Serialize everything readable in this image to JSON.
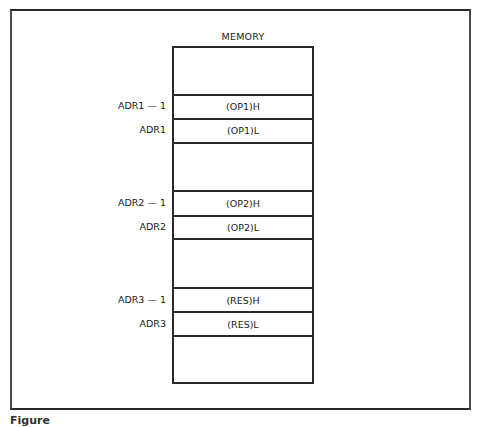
{
  "diagram": {
    "title": "MEMORY",
    "cells": [
      {
        "address": "",
        "content": ""
      },
      {
        "address": "ADR1 — 1",
        "content": "(OP1)H"
      },
      {
        "address": "ADR1",
        "content": "(OP1)L"
      },
      {
        "address": "",
        "content": ""
      },
      {
        "address": "ADR2 — 1",
        "content": "(OP2)H"
      },
      {
        "address": "ADR2",
        "content": "(OP2)L"
      },
      {
        "address": "",
        "content": ""
      },
      {
        "address": "ADR3 — 1",
        "content": "(RES)H"
      },
      {
        "address": "ADR3",
        "content": "(RES)L"
      },
      {
        "address": "",
        "content": ""
      }
    ],
    "caption": "Figure"
  }
}
